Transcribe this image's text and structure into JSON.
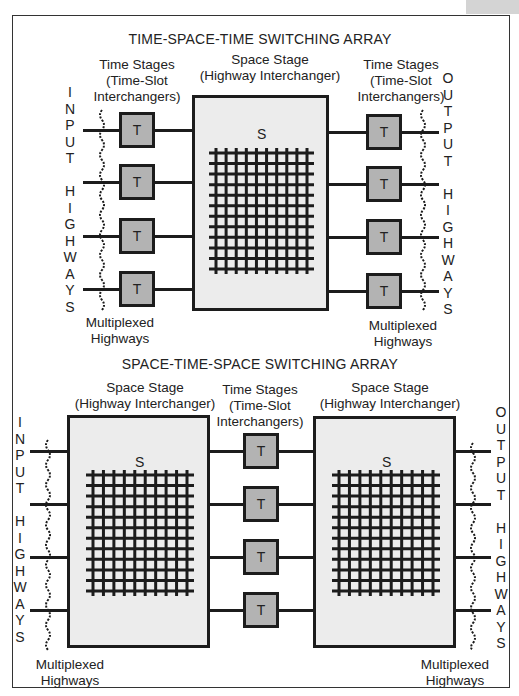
{
  "top": {
    "title": "TIME-SPACE-TIME SWITCHING ARRAY",
    "left_time_label": [
      "Time Stages",
      "(Time-Slot",
      "Interchangers)"
    ],
    "space_label": [
      "Space Stage",
      "(Highway Interchanger)"
    ],
    "right_time_label": [
      "Time Stages",
      "(Time-Slot",
      "Interchangers)"
    ],
    "input_letters": [
      "I",
      "N",
      "P",
      "U",
      "T",
      "",
      "H",
      "I",
      "G",
      "H",
      "W",
      "A",
      "Y",
      "S"
    ],
    "output_letters": [
      "O",
      "U",
      "T",
      "P",
      "U",
      "T",
      "",
      "H",
      "I",
      "G",
      "H",
      "W",
      "A",
      "Y",
      "S"
    ],
    "stage_symbol": "S",
    "time_symbol": "T",
    "left_mux_label": [
      "Multiplexed",
      "Highways"
    ],
    "right_mux_label": [
      "Multiplexed",
      "Highways"
    ],
    "grid": {
      "vertical_lines": 10,
      "horizontal_lines": 12
    }
  },
  "bottom": {
    "title": "SPACE-TIME-SPACE SWITCHING ARRAY",
    "left_space_label": [
      "Space Stage",
      "(Highway Interchanger)"
    ],
    "time_label": [
      "Time Stages",
      "(Time-Slot",
      "Interchangers)"
    ],
    "right_space_label": [
      "Space Stage",
      "(Highway Interchanger)"
    ],
    "input_letters": [
      "I",
      "N",
      "P",
      "U",
      "T",
      "",
      "H",
      "I",
      "G",
      "H",
      "W",
      "A",
      "Y",
      "S"
    ],
    "output_letters": [
      "O",
      "U",
      "T",
      "P",
      "U",
      "T",
      "",
      "H",
      "I",
      "G",
      "H",
      "W",
      "A",
      "Y",
      "S"
    ],
    "stage_symbol": "S",
    "time_symbol": "T",
    "left_mux_label": [
      "Multiplexed",
      "Highways"
    ],
    "right_mux_label": [
      "Multiplexed",
      "Highways"
    ],
    "grid": {
      "vertical_lines": 10,
      "horizontal_lines": 12
    }
  },
  "colors": {
    "stroke": "#1c1c1c",
    "space_fill": "#ececec",
    "time_fill": "#b3b3b3",
    "tab": "#d4d4d4"
  }
}
